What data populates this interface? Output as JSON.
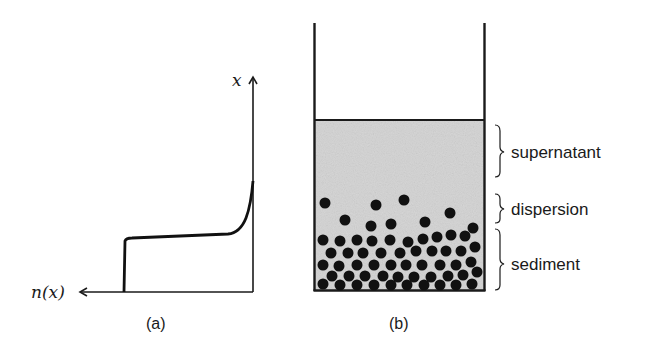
{
  "panel_a": {
    "caption": "(a)",
    "x_axis_label": "n(x)",
    "y_axis_label": "x",
    "curve_description": "concentration profile: zero near top, steep rise at far right, plateau in middle, sharp step to sediment near bottom"
  },
  "panel_b": {
    "caption": "(b)",
    "regions": [
      {
        "label": "supernatant"
      },
      {
        "label": "dispersion"
      },
      {
        "label": "sediment"
      }
    ],
    "colors": {
      "liquid": "#d6d6d6",
      "particle": "#111111",
      "wall": "#1a1a1a"
    }
  }
}
